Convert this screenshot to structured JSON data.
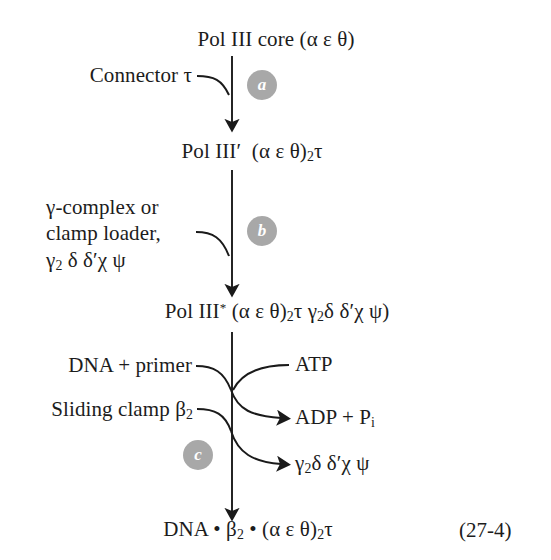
{
  "figure": {
    "equation_number": "(27-4)",
    "accent_color": "#a8a8a8",
    "text_color": "#1c1c1c",
    "background_color": "#ffffff"
  },
  "species": {
    "start": "Pol III core (α ε θ)",
    "intermediate_1_name": "Pol III′",
    "intermediate_1_formula": "(α ε θ)",
    "intermediate_1_sub": "2",
    "intermediate_1_tail": "τ",
    "intermediate_2_name": "Pol III",
    "intermediate_2_star": "*",
    "intermediate_2_formula_a": "(α ε θ)",
    "intermediate_2_sub_a": "2",
    "intermediate_2_mid": "τ γ",
    "intermediate_2_sub_b": "2",
    "intermediate_2_tail": "δ δ′χ ψ)",
    "product_a": "DNA • β",
    "product_sub": "2",
    "product_b": " • (α ε θ)",
    "product_sub_2": "2",
    "product_c": "τ"
  },
  "steps": [
    {
      "id": "a",
      "label": "a"
    },
    {
      "id": "b",
      "label": "b"
    },
    {
      "id": "c",
      "label": "c"
    }
  ],
  "reactants": {
    "connector": "Connector τ",
    "gamma_line1": "γ-complex or",
    "gamma_line2": "clamp loader,",
    "gamma_line3_a": "γ",
    "gamma_line3_sub": "2",
    "gamma_line3_b": " δ δ′χ ψ",
    "dna_primer": "DNA + primer",
    "sliding_clamp_a": "Sliding clamp β",
    "sliding_clamp_sub": "2",
    "atp": "ATP"
  },
  "products": {
    "adp_a": "ADP + P",
    "adp_sub": "i",
    "released_a": "γ",
    "released_sub": "2",
    "released_b": "δ δ′χ ψ"
  }
}
